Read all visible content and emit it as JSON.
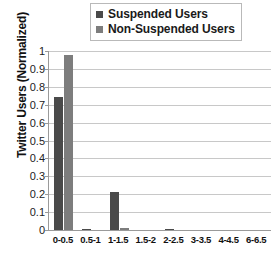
{
  "chart_data": {
    "type": "bar",
    "title": "",
    "xlabel": "",
    "ylabel": "Twitter Users (Normalized)",
    "categories": [
      "0-0.5",
      "0.5-1",
      "1-1.5",
      "1.5-2",
      "2-2.5",
      "3-3.5",
      "4-4.5",
      "6-6.5"
    ],
    "series": [
      {
        "name": "Suspended Users",
        "color": "#4a4a4a",
        "values": [
          0.745,
          0.005,
          0.215,
          0,
          0.008,
          0,
          0,
          0
        ]
      },
      {
        "name": "Non-Suspended Users",
        "color": "#7d7d7d",
        "values": [
          0.975,
          0,
          0.01,
          0,
          0,
          0,
          0,
          0
        ]
      }
    ],
    "ylim": [
      0,
      1
    ],
    "ytick_labels": [
      "1",
      "0.9",
      "0.8",
      "0.7",
      "0.6",
      "0.5",
      "0.4",
      "0.3",
      "0.2",
      "0.1",
      "0"
    ],
    "ytick_values": [
      1,
      0.9,
      0.8,
      0.7,
      0.6,
      0.5,
      0.4,
      0.3,
      0.2,
      0.1,
      0
    ],
    "grid": true,
    "legend_position": "top"
  },
  "legend": {
    "items": [
      {
        "label": "Suspended Users",
        "color": "#4a4a4a"
      },
      {
        "label": "Non-Suspended Users",
        "color": "#7d7d7d"
      }
    ]
  }
}
